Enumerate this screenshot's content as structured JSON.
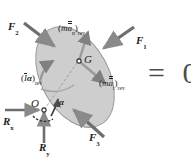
{
  "figure": {
    "body_shape": "ellipse",
    "body_fill": "#cfcfcf",
    "body_stroke": "#8c8c8c",
    "arrow_color": "#808080",
    "text_color": "#231f20",
    "equation_color": "#4d4d4d",
    "background": "#ffffff"
  },
  "points": {
    "center_of_mass": "G",
    "pivot": "O"
  },
  "forces": [
    {
      "name": "F1",
      "letter": "F",
      "sub": "1"
    },
    {
      "name": "F2",
      "letter": "F",
      "sub": "2"
    },
    {
      "name": "F3",
      "letter": "F",
      "sub": "3"
    }
  ],
  "reactions": [
    {
      "name": "Rx",
      "letter": "R",
      "sub": "x"
    },
    {
      "name": "Ry",
      "letter": "R",
      "sub": "y"
    }
  ],
  "inertia_terms": [
    {
      "name": "normal-inertia",
      "open": "(",
      "m": "m",
      "a": "a",
      "a_sub": "n",
      "close": ")",
      "rev": "rev",
      "text": "(mān)rev"
    },
    {
      "name": "tangential-inertia",
      "open": "(",
      "m": "m",
      "a": "a",
      "a_sub": "t",
      "close": ")",
      "rev": "rev",
      "text": "(māt)rev"
    },
    {
      "name": "moment-inertia",
      "open": "(",
      "i": "I",
      "alpha": "α",
      "close": ")",
      "rev": "rev",
      "text": "(Iα)rev"
    }
  ],
  "angular_acceleration": {
    "name": "alpha",
    "symbol": "α"
  },
  "equation": {
    "equals": "=",
    "value": "0",
    "text": "= 0"
  }
}
